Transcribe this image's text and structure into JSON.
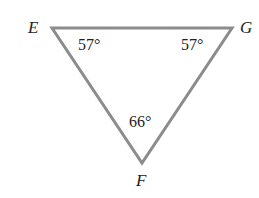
{
  "figure": {
    "type": "triangle",
    "stroke_color": "#8c8c8c",
    "text_color": "#222222",
    "vertices": {
      "E": {
        "label": "E",
        "angle": "57°"
      },
      "G": {
        "label": "G",
        "angle": "57°"
      },
      "F": {
        "label": "F",
        "angle": "66°"
      }
    },
    "sides": [
      "EG",
      "GF",
      "FE"
    ]
  }
}
